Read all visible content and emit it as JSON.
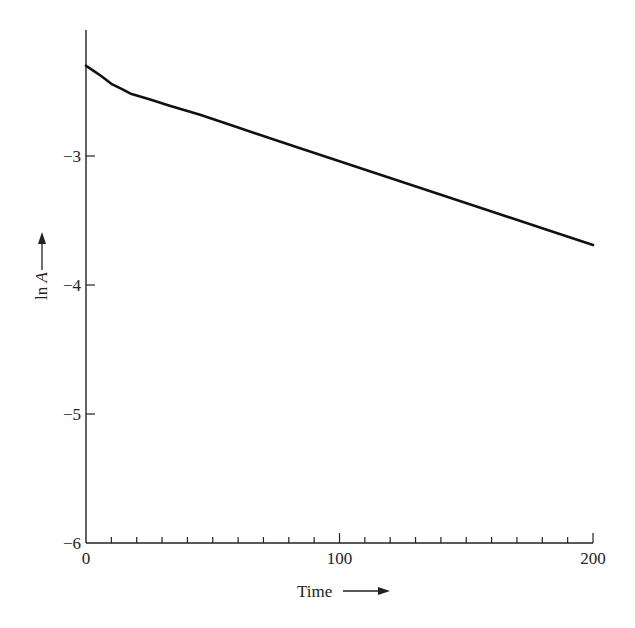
{
  "chart_data": {
    "type": "line",
    "title": "",
    "xlabel": "Time",
    "ylabel_prefix": "ln ",
    "ylabel_var": "A",
    "xlim": [
      0,
      200
    ],
    "ylim": [
      -6,
      -2.1
    ],
    "x_major_ticks": [
      0,
      100,
      200
    ],
    "x_major_tick_labels": [
      "0",
      "100",
      "200"
    ],
    "x_minor_step": 10,
    "y_ticks": [
      -3,
      -4,
      -5,
      -6
    ],
    "y_tick_labels": [
      "-3",
      "-4",
      "-5",
      "-6"
    ],
    "grid": false,
    "legend": "none",
    "series": [
      {
        "name": "ln A",
        "x": [
          0,
          3,
          6,
          10,
          14,
          18,
          25,
          33,
          45,
          60,
          80,
          100,
          120,
          140,
          160,
          180,
          200
        ],
        "y": [
          -2.3,
          -2.34,
          -2.38,
          -2.44,
          -2.48,
          -2.52,
          -2.56,
          -2.61,
          -2.68,
          -2.78,
          -2.91,
          -3.04,
          -3.17,
          -3.3,
          -3.43,
          -3.56,
          -3.69
        ]
      }
    ]
  }
}
